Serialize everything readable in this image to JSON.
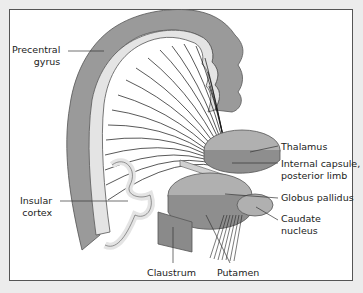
{
  "figure": {
    "labels": {
      "precentral_gyrus": [
        "Precentral",
        "gyrus"
      ],
      "thalamus": "Thalamus",
      "internal_capsule": [
        "Internal capsule,",
        "posterior limb"
      ],
      "globus_pallidus": "Globus pallidus",
      "caudate_nucleus": [
        "Caudate",
        "nucleus"
      ],
      "insular_cortex": [
        "Insular",
        "cortex"
      ],
      "claustrum": "Claustrum",
      "putamen": "Putamen"
    },
    "colors": {
      "background": "#ececec",
      "panel": "#ffffff",
      "gray_matter": "#9a9a9a",
      "white_matter": "#e4e4e4",
      "nuclei": "#b0b0b0",
      "fibers": "#111111"
    }
  }
}
